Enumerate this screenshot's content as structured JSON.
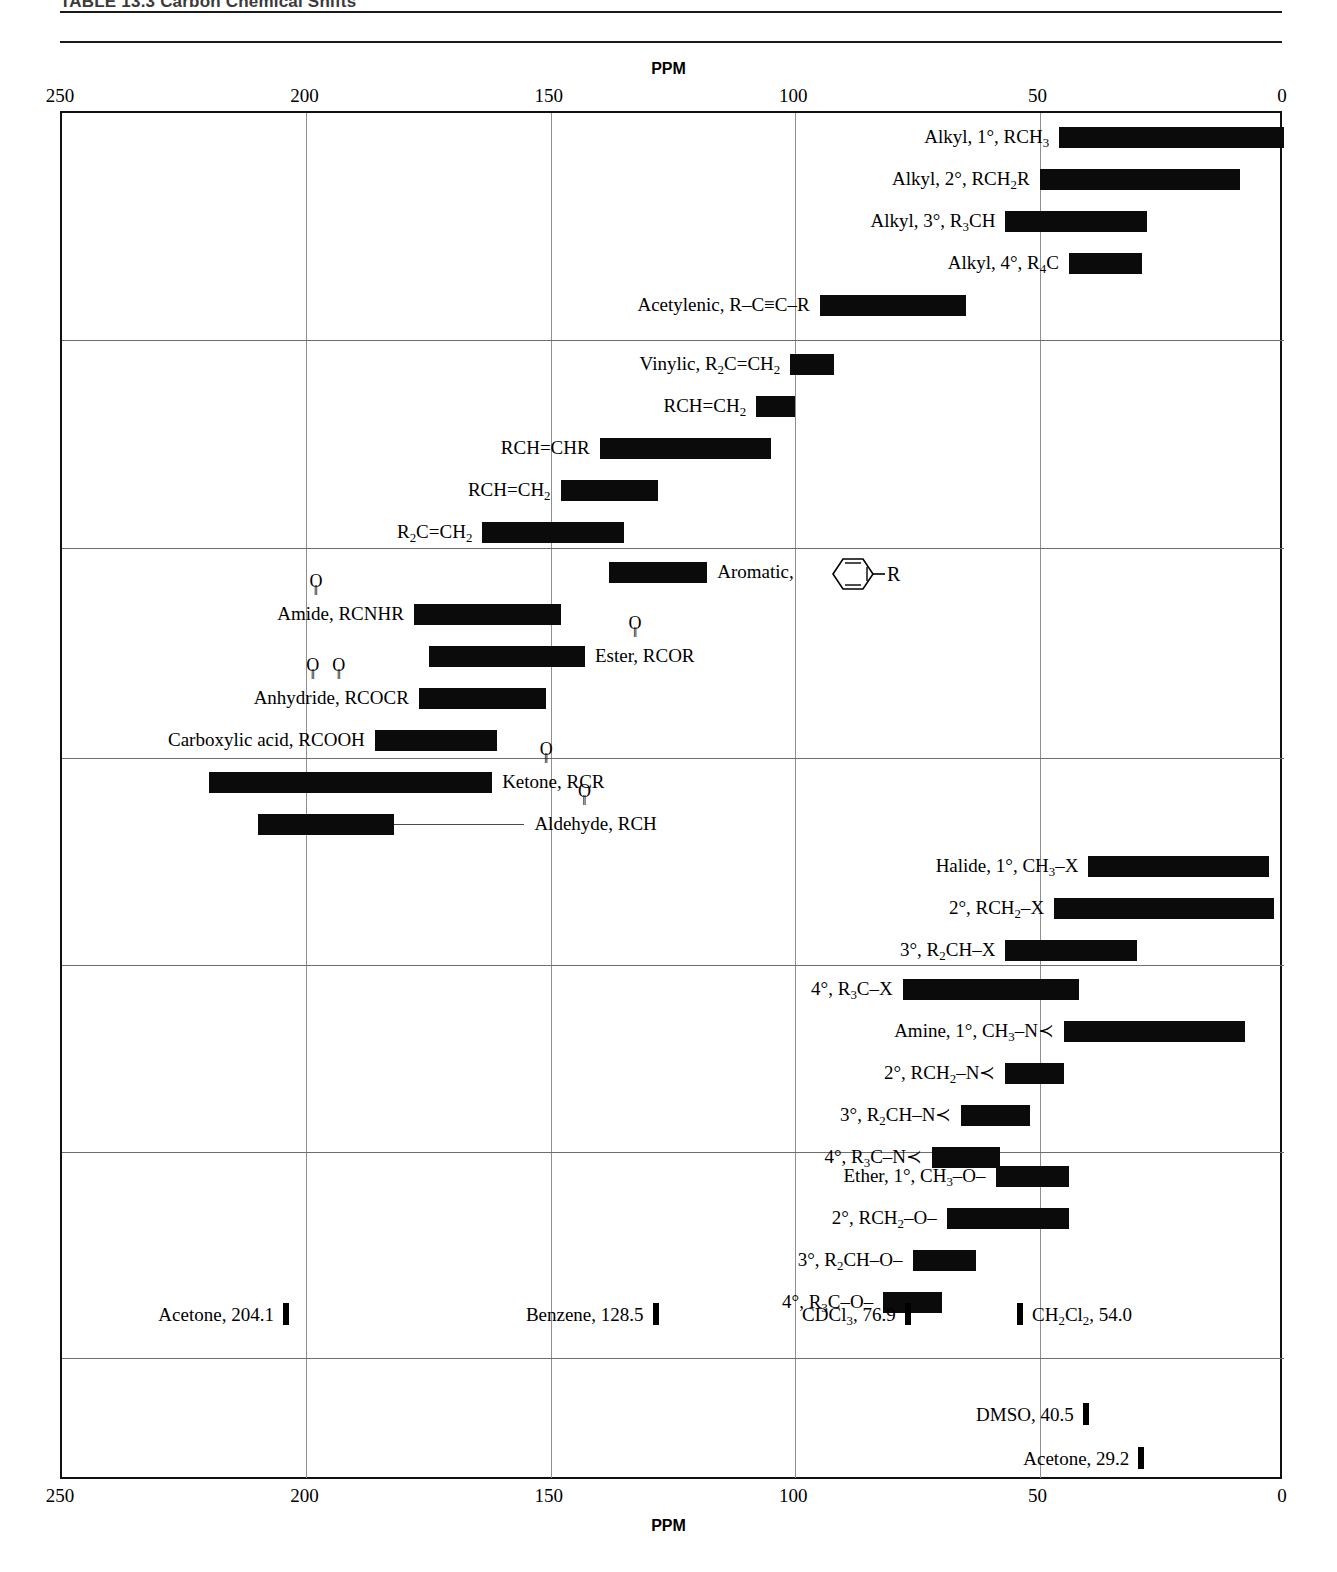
{
  "title": "TABLE 13.3   Carbon Chemical Shifts",
  "axis": {
    "label": "PPM",
    "ticks": [
      250,
      200,
      150,
      100,
      50,
      0
    ],
    "min": 0,
    "max": 250,
    "direction": "reversed"
  },
  "chart_data": {
    "type": "bar",
    "title": "TABLE 13.3   Carbon Chemical Shifts",
    "xlabel": "PPM",
    "ylabel": "",
    "xlim": [
      250,
      0
    ],
    "grid": true,
    "orientation": "horizontal-range",
    "note": "Each entry is a carbon-13 chemical shift range (ppm) shown as a horizontal bar; solvent entries are single-value reference lines.",
    "bands": [
      {
        "name": "alkyl-acetylenic",
        "entries": [
          {
            "label": "Alkyl, 1°, RCH3",
            "label_html": "Alkyl, 1°, RCH<sub>3</sub>",
            "from": 46,
            "to": 0,
            "label_side": "left"
          },
          {
            "label": "Alkyl, 2°, RCH2R",
            "label_html": "Alkyl, 2°, RCH<sub>2</sub>R",
            "from": 50,
            "to": 9,
            "label_side": "left"
          },
          {
            "label": "Alkyl, 3°, R3CH",
            "label_html": "Alkyl, 3°, R<sub>3</sub>CH",
            "from": 57,
            "to": 28,
            "label_side": "left"
          },
          {
            "label": "Alkyl, 4°, R4C",
            "label_html": "Alkyl, 4°, R<sub>4</sub>C",
            "from": 44,
            "to": 29,
            "label_side": "left"
          },
          {
            "label": "Acetylenic, R–C≡C–R",
            "label_html": "Acetylenic, R–C≡C–R",
            "from": 95,
            "to": 65,
            "label_side": "left"
          }
        ]
      },
      {
        "name": "vinylic",
        "entries": [
          {
            "label": "Vinylic, R2C=CH2",
            "label_html": "Vinylic, R<sub>2</sub>C=CH<sub>2</sub>",
            "from": 101,
            "to": 92,
            "label_side": "left"
          },
          {
            "label": "RCH=CH2",
            "label_html": "RCH=CH<sub>2</sub>",
            "from": 108,
            "to": 100,
            "label_side": "left"
          },
          {
            "label": "RCH=CHR",
            "label_html": "RCH=CHR",
            "from": 140,
            "to": 105,
            "label_side": "left"
          },
          {
            "label": "RCH=CH2",
            "label_html": "RCH=CH<sub>2</sub>",
            "from": 148,
            "to": 128,
            "label_side": "left"
          },
          {
            "label": "R2C=CH2",
            "label_html": "R<sub>2</sub>C=CH<sub>2</sub>",
            "from": 164,
            "to": 135,
            "label_side": "left"
          }
        ]
      },
      {
        "name": "aromatic-carbonyl",
        "entries": [
          {
            "label": "Aromatic,",
            "label_html": "Aromatic,",
            "from": 138,
            "to": 118,
            "label_side": "right",
            "glyph": "benzene-ring-R"
          },
          {
            "label": "Amide, RCNHR",
            "label_html": "Amide, RCNHR",
            "from": 178,
            "to": 148,
            "label_side": "left",
            "carbonyl": true,
            "carbonyl_offset": 88
          },
          {
            "label": "Ester, RCOR",
            "label_html": "Ester, RCOR",
            "from": 175,
            "to": 143,
            "label_side": "right",
            "carbonyl": true,
            "carbonyl_offset": 60
          },
          {
            "label": "Anhydride, RCOCR",
            "label_html": "Anhydride, RCOCR",
            "from": 177,
            "to": 151,
            "label_side": "left",
            "carbonyl": "double",
            "carbonyl_offset": 96
          },
          {
            "label": "Carboxylic acid, RCOOH",
            "label_html": "Carboxylic acid, RCOOH",
            "from": 186,
            "to": 161,
            "label_side": "left"
          }
        ]
      },
      {
        "name": "ketone-aldehyde-halide",
        "entries": [
          {
            "label": "Ketone, RCR",
            "label_html": "Ketone, RCR",
            "from": 220,
            "to": 162,
            "label_side": "right",
            "carbonyl": true,
            "carbonyl_offset": 58
          },
          {
            "label": "Aldehyde, RCH",
            "label_html": "Aldehyde, RCH",
            "from": 210,
            "to": 182,
            "label_side": "right",
            "carbonyl": true,
            "carbonyl_offset": 72,
            "leader": true
          },
          {
            "label": "Halide, 1°, CH3–X",
            "label_html": "Halide, 1°, CH<sub>3</sub>–X",
            "from": 40,
            "to": 3,
            "label_side": "left"
          },
          {
            "label": "2°, RCH2–X",
            "label_html": "2°, RCH<sub>2</sub>–X",
            "from": 47,
            "to": 2,
            "label_side": "left"
          },
          {
            "label": "3°, R2CH–X",
            "label_html": "3°, R<sub>2</sub>CH–X",
            "from": 57,
            "to": 30,
            "label_side": "left"
          }
        ]
      },
      {
        "name": "amine",
        "entries": [
          {
            "label": "4°, R3C–X",
            "label_html": "4°, R<sub>3</sub>C–X",
            "from": 78,
            "to": 42,
            "label_side": "left"
          },
          {
            "label": "Amine, 1°, CH3–N<",
            "label_html": "Amine, 1°, CH<sub>3</sub>–N≺",
            "from": 45,
            "to": 8,
            "label_side": "left"
          },
          {
            "label": "2°, RCH2–N<",
            "label_html": "2°, RCH<sub>2</sub>–N≺",
            "from": 57,
            "to": 45,
            "label_side": "left"
          },
          {
            "label": "3°, R2CH–N<",
            "label_html": "3°, R<sub>2</sub>CH–N≺",
            "from": 66,
            "to": 52,
            "label_side": "left"
          },
          {
            "label": "4°, R3C–N<",
            "label_html": "4°, R<sub>3</sub>C–N≺",
            "from": 72,
            "to": 58,
            "label_side": "left"
          }
        ]
      },
      {
        "name": "ether",
        "entries": [
          {
            "label": "Ether, 1°, CH3–O–",
            "label_html": "Ether, 1°, CH<sub>3</sub>–O–",
            "from": 59,
            "to": 44,
            "label_side": "left"
          },
          {
            "label": "2°, RCH2–O–",
            "label_html": "2°, RCH<sub>2</sub>–O–",
            "from": 69,
            "to": 44,
            "label_side": "left"
          },
          {
            "label": "3°, R2CH–O–",
            "label_html": "3°, R<sub>2</sub>CH–O–",
            "from": 76,
            "to": 63,
            "label_side": "left"
          },
          {
            "label": "4°, R3C–O–",
            "label_html": "4°, R<sub>3</sub>C–O–",
            "from": 82,
            "to": 70,
            "label_side": "left"
          }
        ]
      }
    ],
    "solvents": [
      {
        "label": "Acetone, 204.1",
        "label_html": "Acetone, 204.1",
        "value": 204.1,
        "label_side": "left",
        "band": 6
      },
      {
        "label": "Benzene, 128.5",
        "label_html": "Benzene, 128.5",
        "value": 128.5,
        "label_side": "left",
        "band": 6
      },
      {
        "label": "CDCl3, 76.9",
        "label_html": "CDCl<sub>3</sub>, 76.9",
        "value": 76.9,
        "label_side": "left",
        "band": 6
      },
      {
        "label": "CH2Cl2, 54.0",
        "label_html": "CH<sub>2</sub>Cl<sub>2</sub>, 54.0",
        "value": 54.0,
        "label_side": "right",
        "band": 6
      },
      {
        "label": "DMSO, 40.5",
        "label_html": "DMSO, 40.5",
        "value": 40.5,
        "label_side": "left",
        "band": 7
      },
      {
        "label": "Acetone, 29.2",
        "label_html": "Acetone, 29.2",
        "value": 29.2,
        "label_side": "left",
        "band": 7
      }
    ]
  },
  "colors": {
    "bar": "#0b0b0b",
    "grid": "#8f8f8f",
    "band_separator": "#6e6e6e",
    "frame": "#111111",
    "title": "#3a3a3a"
  }
}
